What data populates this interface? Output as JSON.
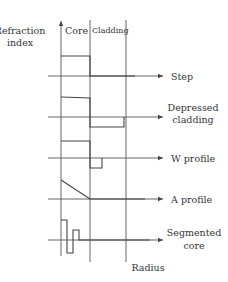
{
  "diagram": {
    "y_axis_label_line1": "Refraction",
    "y_axis_label_line2": "index",
    "x_axis_label": "Radius",
    "region_labels": {
      "core": "Core",
      "cladding": "Cladding"
    },
    "profiles": [
      {
        "id": "step",
        "label_lines": [
          "Step"
        ]
      },
      {
        "id": "depressed-cladding",
        "label_lines": [
          "Depressed",
          "cladding"
        ]
      },
      {
        "id": "w-profile",
        "label_lines": [
          "W profile"
        ]
      },
      {
        "id": "a-profile",
        "label_lines": [
          "A profile"
        ]
      },
      {
        "id": "segmented-core",
        "label_lines": [
          "Segmented",
          "core"
        ]
      }
    ],
    "colors": {
      "line": "#444444",
      "text": "#333333",
      "background": "#ffffff"
    }
  }
}
